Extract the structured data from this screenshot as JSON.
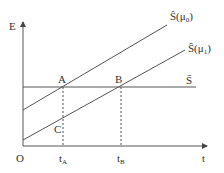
{
  "diagram": {
    "axes": {
      "y_label": "E",
      "x_label": "t",
      "origin_label": "O"
    },
    "lines": [
      {
        "name": "S-hat(mu0)",
        "label_main": "Ŝ(μ",
        "label_sub": "0",
        "label_end": ")"
      },
      {
        "name": "S-hat(mu1)",
        "label_main": "Ŝ(μ",
        "label_sub": "1",
        "label_end": ")"
      },
      {
        "name": "S-bar",
        "label": "S̄"
      }
    ],
    "points": {
      "A": "A",
      "B": "B",
      "C": "C"
    },
    "ticks": {
      "tA_main": "t",
      "tA_sub": "A",
      "tB_main": "t",
      "tB_sub": "B"
    },
    "colors": {
      "line": "#555555",
      "text": "#333333"
    }
  }
}
